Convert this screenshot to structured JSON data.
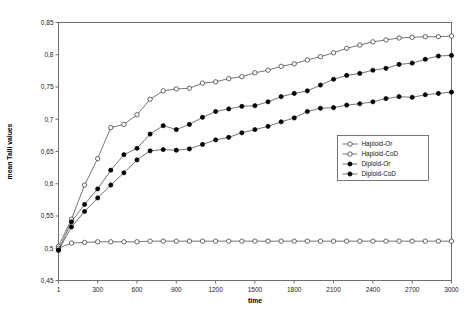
{
  "chart_data": {
    "type": "line",
    "title": "",
    "xlabel": "time",
    "ylabel": "mean Talli values",
    "xlim": [
      1,
      3000
    ],
    "ylim": [
      0.45,
      0.85
    ],
    "grid": false,
    "legend_position": "right-middle",
    "x": [
      1,
      100,
      200,
      300,
      400,
      500,
      600,
      700,
      800,
      900,
      1000,
      1100,
      1200,
      1300,
      1400,
      1500,
      1600,
      1700,
      1800,
      1900,
      2000,
      2100,
      2200,
      2300,
      2400,
      2500,
      2600,
      2700,
      2800,
      2900,
      3000
    ],
    "xtick_labels": [
      "1",
      "300",
      "600",
      "900",
      "1200",
      "1500",
      "1800",
      "2100",
      "2400",
      "2700",
      "3000"
    ],
    "xtick_values": [
      1,
      300,
      600,
      900,
      1200,
      1500,
      1800,
      2100,
      2400,
      2700,
      3000
    ],
    "ytick_labels": [
      "0,45",
      "0,5",
      "0,55",
      "0,6",
      "0,65",
      "0,7",
      "0,75",
      "0,8",
      "0,85"
    ],
    "ytick_values": [
      0.45,
      0.5,
      0.55,
      0.6,
      0.65,
      0.7,
      0.75,
      0.8,
      0.85
    ],
    "series": [
      {
        "name": "Haploid-Or",
        "marker": "open-circle",
        "values": [
          0.503,
          0.545,
          0.598,
          0.639,
          0.687,
          0.692,
          0.707,
          0.731,
          0.744,
          0.747,
          0.748,
          0.756,
          0.758,
          0.763,
          0.766,
          0.772,
          0.776,
          0.782,
          0.786,
          0.792,
          0.797,
          0.803,
          0.81,
          0.815,
          0.82,
          0.823,
          0.826,
          0.827,
          0.828,
          0.828,
          0.829
        ]
      },
      {
        "name": "Haploid-CoD",
        "marker": "open-circle",
        "values": [
          0.5,
          0.508,
          0.509,
          0.51,
          0.51,
          0.51,
          0.51,
          0.511,
          0.511,
          0.511,
          0.511,
          0.511,
          0.511,
          0.511,
          0.511,
          0.511,
          0.511,
          0.511,
          0.511,
          0.511,
          0.511,
          0.511,
          0.511,
          0.511,
          0.511,
          0.511,
          0.511,
          0.511,
          0.511,
          0.511,
          0.511
        ]
      },
      {
        "name": "Diploid-Or",
        "marker": "filled-circle",
        "values": [
          0.497,
          0.541,
          0.568,
          0.592,
          0.621,
          0.645,
          0.655,
          0.677,
          0.69,
          0.684,
          0.692,
          0.703,
          0.712,
          0.716,
          0.72,
          0.721,
          0.727,
          0.735,
          0.74,
          0.744,
          0.753,
          0.762,
          0.768,
          0.771,
          0.776,
          0.779,
          0.785,
          0.787,
          0.793,
          0.798,
          0.799
        ]
      },
      {
        "name": "Diploid-CoD",
        "marker": "filled-circle",
        "values": [
          0.497,
          0.533,
          0.557,
          0.578,
          0.598,
          0.617,
          0.637,
          0.651,
          0.653,
          0.652,
          0.654,
          0.661,
          0.668,
          0.672,
          0.679,
          0.684,
          0.689,
          0.696,
          0.702,
          0.712,
          0.717,
          0.718,
          0.722,
          0.724,
          0.727,
          0.732,
          0.735,
          0.734,
          0.738,
          0.74,
          0.742
        ]
      }
    ]
  },
  "legend": {
    "items": [
      {
        "label": "Haploid-Or",
        "marker": "open-circle"
      },
      {
        "label": "Haploid-CoD",
        "marker": "open-circle"
      },
      {
        "label": "Diploid-Or",
        "marker": "filled-circle"
      },
      {
        "label": "Diploid-CoD",
        "marker": "filled-circle"
      }
    ]
  },
  "colors": {
    "line": "#3a3a3a",
    "frame": "#6f6f6f",
    "marker_fill_open": "#ffffff",
    "marker_fill_closed": "#000000",
    "text": "#111111",
    "background": "#ffffff"
  }
}
